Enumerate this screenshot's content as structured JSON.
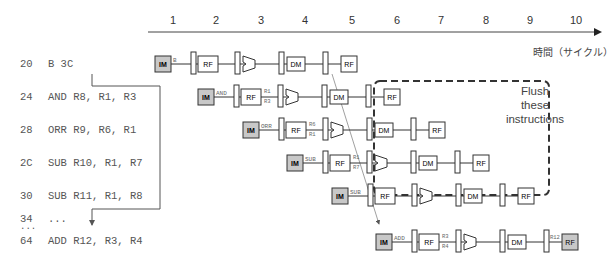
{
  "timeline": {
    "cycles": [
      "1",
      "2",
      "3",
      "4",
      "5",
      "6",
      "7",
      "8",
      "9",
      "10"
    ],
    "axis_label": "時間（サイクル）"
  },
  "instructions": [
    {
      "addr": "20",
      "code": "B 3C",
      "op": "B",
      "src1": "",
      "src2": "",
      "dst": ""
    },
    {
      "addr": "24",
      "code": "AND R8, R1, R3",
      "op": "AND",
      "src1": "R1",
      "src2": "R3",
      "dst": ""
    },
    {
      "addr": "28",
      "code": "ORR R9, R6, R1",
      "op": "ORR",
      "src1": "R6",
      "src2": "R1",
      "dst": ""
    },
    {
      "addr": "2C",
      "code": "SUB R10, R1, R7",
      "op": "SUB",
      "src1": "R1",
      "src2": "R7",
      "dst": ""
    },
    {
      "addr": "30",
      "code": "SUB R11, R1, R8",
      "op": "SUB",
      "src1": "",
      "src2": "",
      "dst": ""
    },
    {
      "addr": "34",
      "code": "...",
      "op": "",
      "src1": "",
      "src2": "",
      "dst": ""
    },
    {
      "addr": "...",
      "code": "",
      "op": "",
      "src1": "",
      "src2": "",
      "dst": ""
    },
    {
      "addr": "64",
      "code": "ADD R12, R3, R4",
      "op": "ADD",
      "src1": "R3",
      "src2": "R4",
      "dst": "R12"
    }
  ],
  "stages": {
    "im": "IM",
    "rf": "RF",
    "dm": "DM"
  },
  "flush_box": {
    "line1": "Flush",
    "line2": "these",
    "line3": "instructions"
  },
  "colors": {
    "stage_fill": "#d0d0d0",
    "line": "#333333",
    "text": "#555555"
  }
}
